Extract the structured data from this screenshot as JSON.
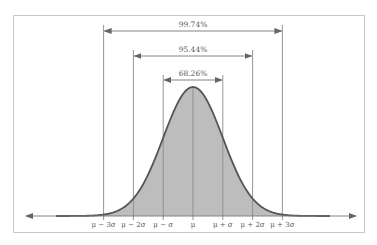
{
  "chart_data": {
    "type": "area",
    "title": "",
    "mean": 0,
    "sd": 1,
    "x_tick_labels": [
      "μ − 3σ",
      "μ − 2σ",
      "μ − σ",
      "μ",
      "μ + σ",
      "μ + 2σ",
      "μ + 3σ"
    ],
    "x_tick_values": [
      -3,
      -2,
      -1,
      0,
      1,
      2,
      3
    ],
    "intervals": [
      {
        "label": "68.26%",
        "from": -1,
        "to": 1,
        "percent": 68.26
      },
      {
        "label": "95.44%",
        "from": -2,
        "to": 2,
        "percent": 95.44
      },
      {
        "label": "99.74%",
        "from": -3,
        "to": 3,
        "percent": 99.74
      }
    ],
    "xlabel": "",
    "ylabel": "",
    "grid": false,
    "legend": "none"
  },
  "colors": {
    "frame": "#c8c8c8",
    "fill": "#bdbdbd",
    "curve": "#555555",
    "lines": "#8a8a8a",
    "text": "#555555"
  }
}
